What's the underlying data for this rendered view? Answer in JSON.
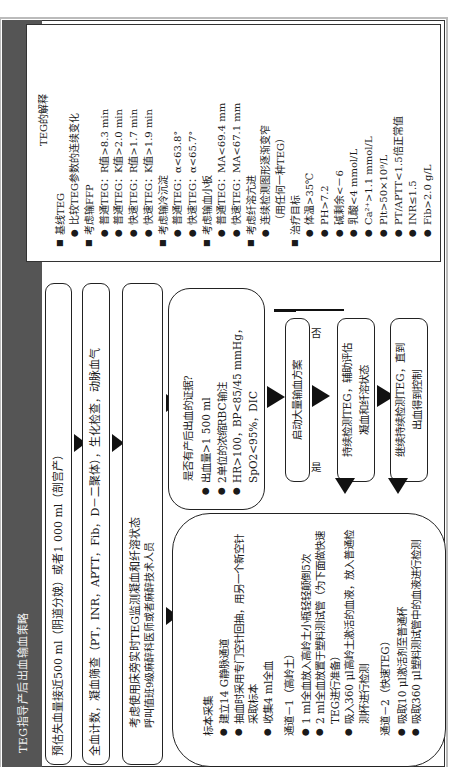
{
  "title": "TEG指导产后出血输血策略",
  "flow": {
    "step1": "预估失血量接近500 ml（阴道分娩）或者1 000 ml（剖宫产）",
    "step2": "全血计数，凝血筛查（PT，INR，APTT，Fib，D－二聚体），生化检查，动脉血气",
    "step3": {
      "line1": "考虑使用床旁实时TEG监测凝血和纤溶状态",
      "line2": "呼叫值班9级麻醉科医师或者麻醉技术人员"
    },
    "sample_box": {
      "heading": "标本采集",
      "items": [
        "建立14 G静脉通道",
        "抽血时采用专门空针回抽，用另一个新空针采取标本",
        "收集4 ml全血"
      ],
      "channel1": {
        "heading": "通道－1（高岭土）",
        "items": [
          "1 ml全血放入高岭土小瓶轻轻颠倒5次",
          "2 ml全血放置于塑料测试管（为下面做快速TEG进行准备）",
          "吸入360 μl高岭土激活的血液，放入普通检测杯进行检测"
        ]
      },
      "channel2": {
        "heading": "通道－2（快速TEG）",
        "items": [
          "吸取10 μl激活剂至普通杯",
          "吸取360 μl塑料测试管中的血液进行检测"
        ]
      }
    },
    "question_box": {
      "heading": "是否有产后出血的证据?",
      "items": [
        "出血量>1 500 ml",
        "2单位的浓缩RBC输注",
        "HR>100，BP<85/45 mmHg，SpO2<95%，DIC"
      ]
    },
    "yes_label": "是",
    "no_label": "否",
    "mtp_box": "启动大量输血方案",
    "monitor_box": {
      "line1": "持续检测TEG，辅助评估",
      "line2": "凝血和纤溶状态"
    },
    "continue_box": {
      "line1": "继续持续检测TEG，直到",
      "line2": "出血得到控制"
    }
  },
  "panel": {
    "title": "TEG的解释",
    "sections": [
      {
        "heading": "基线TEG",
        "items": [
          "比较TEG参数的连续变化"
        ]
      },
      {
        "heading": "考虑输FFP",
        "items": [
          "普通TEG：R值>8.3 min",
          "普通TEG：K值>2.0 min",
          "快速TEG：R值>1.7 min",
          "快速TEG：K值>1.9 min"
        ]
      },
      {
        "heading": "考虑输冷沉淀",
        "items": [
          "普通TEG：α<63.8°",
          "快速TEG：α<65.7°"
        ]
      },
      {
        "heading": "考虑输血小板",
        "items": [
          "普通TEG：MA<69.4 mm",
          "快速TEG：MA<67.1 mm"
        ]
      },
      {
        "heading": "考虑纤溶亢进",
        "items": [
          "连续检测图形逐渐变窄"
        ],
        "note": "（用任何一种TEG）"
      },
      {
        "heading": "治疗目标",
        "items": [
          "体温>35℃",
          "PH>7.2",
          "碱剩余<－6",
          "乳酸<4 mmol/L",
          "Ca²⁺>1.1 mmol/L",
          "Plt>50×10⁹/L",
          "PT/APTT<1.5倍正常值",
          "INR≤1.5",
          "Fib>2.0 g/L"
        ]
      }
    ]
  },
  "colors": {
    "titlebar": "#555555",
    "border": "#222222",
    "background": "#ffffff"
  }
}
